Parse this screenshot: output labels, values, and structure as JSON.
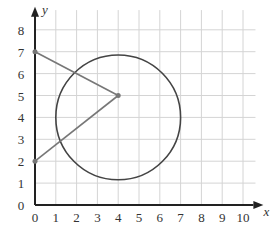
{
  "chart_data": {
    "type": "diagram",
    "title": "",
    "xlabel": "x",
    "ylabel": "y",
    "xlim": [
      0,
      10.5
    ],
    "ylim": [
      0,
      8.5
    ],
    "x_ticks": [
      "0",
      "1",
      "2",
      "3",
      "4",
      "5",
      "6",
      "7",
      "8",
      "9",
      "10"
    ],
    "y_ticks": [
      "0",
      "1",
      "2",
      "3",
      "4",
      "5",
      "6",
      "7",
      "8"
    ],
    "grid": true,
    "circle": {
      "center": [
        4,
        5
      ],
      "radius_hint": "passes through (4,7),(4,1),(1,4),(7,4)",
      "cx": 4,
      "cy": 4,
      "r": 3
    },
    "points": [
      {
        "x": 0,
        "y": 7
      },
      {
        "x": 4,
        "y": 5
      },
      {
        "x": 0,
        "y": 2
      }
    ],
    "segments": [
      [
        [
          0,
          7
        ],
        [
          4,
          5
        ]
      ],
      [
        [
          4,
          5
        ],
        [
          0,
          2
        ]
      ]
    ]
  }
}
